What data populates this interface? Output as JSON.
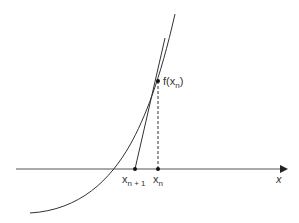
{
  "diagram": {
    "axis_label": "x",
    "point_label": {
      "f": "f(",
      "x": "x",
      "sub": "n",
      "close": ")"
    },
    "xn1_label": {
      "x": "x",
      "sub": "n + 1"
    },
    "xn_label": {
      "x": "x",
      "sub": "n"
    },
    "colors": {
      "line": "#333333"
    }
  }
}
